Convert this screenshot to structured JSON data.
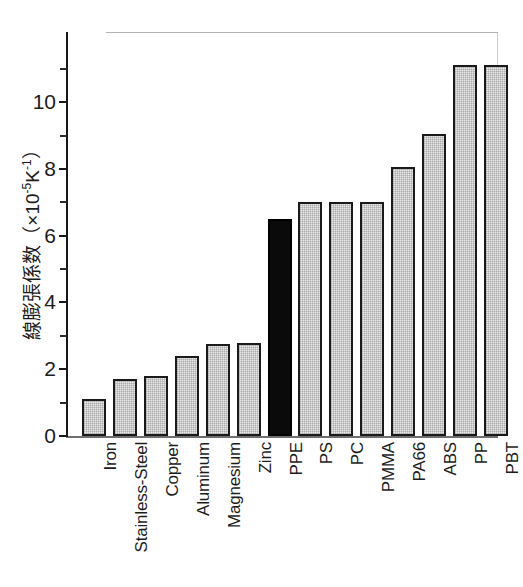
{
  "chart_data": {
    "type": "bar",
    "title": "",
    "xlabel": "",
    "ylabel": "線膨張係数（×10⁻⁵K⁻¹）",
    "ylabel_parts": {
      "text": "線膨張係数（×10",
      "exp1": "-5",
      "mid": "K",
      "exp2": "-1",
      "close": "）"
    },
    "ylim": [
      0,
      12.1
    ],
    "ytick_major": [
      0,
      2,
      4,
      6,
      8,
      10
    ],
    "ytick_major_labels": [
      "0",
      "2",
      "4",
      "6",
      "8",
      "10"
    ],
    "ytick_minor": [
      1,
      3,
      5,
      7,
      9,
      11
    ],
    "grid": false,
    "legend": "none",
    "categories": [
      "Iron",
      "Stainless-Steel",
      "Copper",
      "Aluminum",
      "Magnesium",
      "Zinc",
      "PPE",
      "PS",
      "PC",
      "PMMA",
      "PA66",
      "ABS",
      "PP",
      "PBT"
    ],
    "values": [
      1.1,
      1.7,
      1.8,
      2.4,
      2.75,
      2.8,
      6.5,
      7.0,
      7.0,
      7.0,
      8.05,
      9.05,
      11.1,
      11.1
    ],
    "highlight_index": 6,
    "bar_fill": "#e9e9e9",
    "bar_highlight_fill": "#0a0a0a",
    "bar_edge": "#1a1a1a",
    "axis_color": "#1a1a1a",
    "background": "#ffffff"
  }
}
